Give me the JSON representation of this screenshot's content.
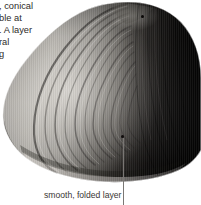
{
  "page": {
    "background_color": "#ffffff",
    "width": 201,
    "height": 205
  },
  "body_text": {
    "name": "clipped-body-paragraph",
    "note": "text column is cut off at the left page margin",
    "lines": [
      ", conical",
      "ble at",
      ". A layer",
      "ral",
      "g"
    ]
  },
  "figure": {
    "name": "shell-photograph",
    "palette": {
      "highlight": "#d8d5d0",
      "midtone": "#8b8883",
      "shadow": "#2a2724",
      "deep_shadow": "#0d0b0a",
      "page": "#ffffff"
    }
  },
  "callouts": {
    "folded_layer": {
      "label": "smooth, folded layer",
      "leader_color": "#7a7774",
      "dot_color": "#100d0c"
    },
    "umbo_point": {
      "dot_color": "#0a0807"
    }
  }
}
